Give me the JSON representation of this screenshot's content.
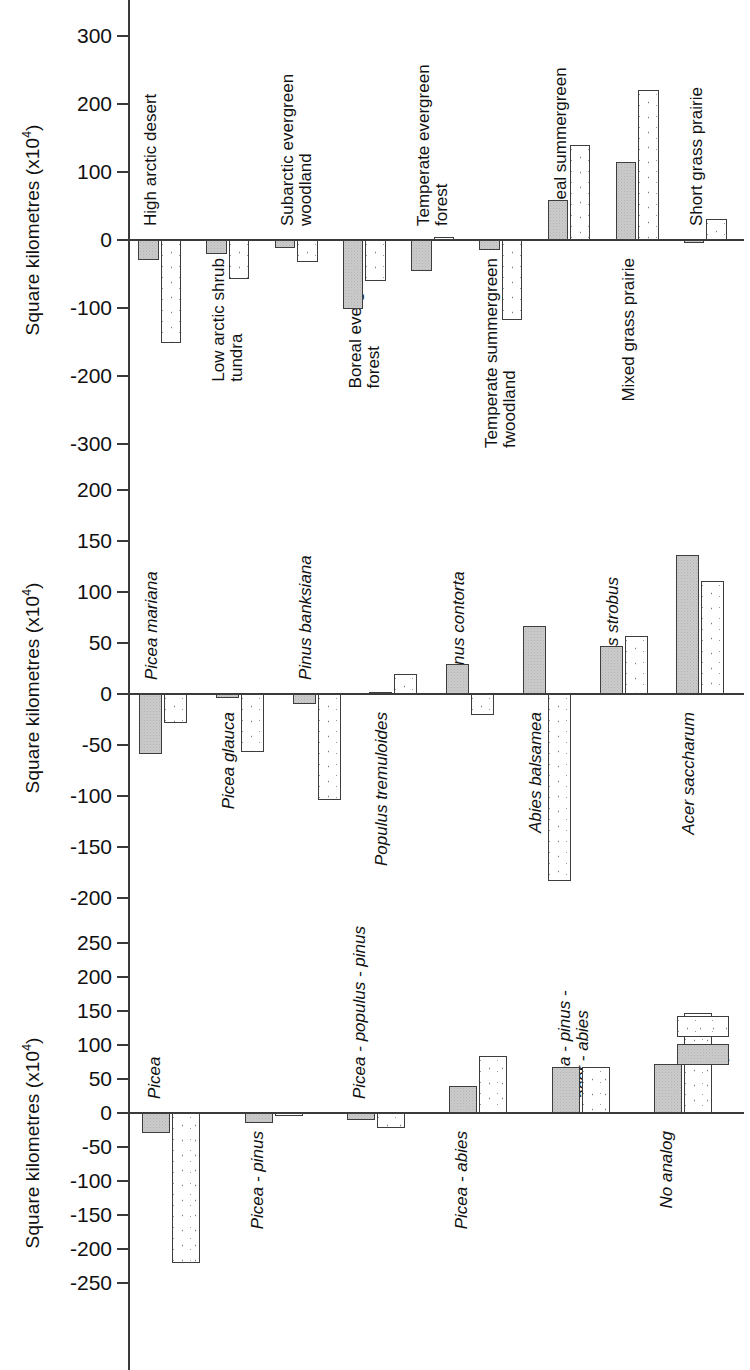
{
  "figure": {
    "axis_label_prefix": "Square kilometres (x10",
    "axis_label_exponent": "4",
    "axis_label_suffix": ")"
  },
  "legend": {
    "position": "right-middle-of-panel-3",
    "entries": [
      {
        "label": "GISS",
        "key": "giss",
        "color": "#ffffff",
        "pattern": "white-sparse-dots"
      },
      {
        "label": "GFDL",
        "key": "gfdl",
        "color": "#cacaca",
        "pattern": "solid-grey-stipple"
      }
    ]
  },
  "chart_data": [
    {
      "type": "bar",
      "title": "Biome area change",
      "xlabel": "",
      "ylabel": "Square kilometres (x10^4)",
      "ylim": [
        -300,
        300
      ],
      "yticks": [
        300,
        200,
        100,
        0,
        -100,
        -200,
        -300
      ],
      "ytick_labels": [
        "300",
        "200",
        "100",
        "0",
        "-100",
        "-200",
        "-300"
      ],
      "grid": false,
      "legend": false,
      "label_style": "upright",
      "categories": [
        "High arctic desert",
        "Low arctic shrub\ntundra",
        "Subarctic evergreen\nwoodland",
        "Boreal evergreen\nforest",
        "Temperate evergreen\nforest",
        "Temperate summergreen\nfwoodland",
        "Boreal summergreen\nwoodland",
        "Mixed grass prairie",
        "Short grass prairie"
      ],
      "category_label_anchor": [
        "above",
        "below",
        "above",
        "below",
        "above",
        "below",
        "above",
        "below",
        "above"
      ],
      "series": [
        {
          "name": "GFDL",
          "key": "gfdl",
          "values": [
            -30,
            -20,
            -12,
            -102,
            -45,
            -14,
            59,
            115,
            -5
          ]
        },
        {
          "name": "GISS",
          "key": "giss",
          "values": [
            -152,
            -58,
            -32,
            -60,
            4,
            -118,
            139,
            220,
            31
          ]
        }
      ]
    },
    {
      "type": "bar",
      "title": "Species area change",
      "xlabel": "",
      "ylabel": "Square kilometres (x10^4)",
      "ylim": [
        -200,
        200
      ],
      "yticks": [
        200,
        150,
        100,
        50,
        0,
        -50,
        -100,
        -150,
        -200
      ],
      "ytick_labels": [
        "200",
        "150",
        "100",
        "50",
        "0",
        "-50",
        "-100",
        "-150",
        "-200"
      ],
      "grid": false,
      "legend": false,
      "label_style": "italic",
      "categories": [
        "Picea mariana",
        "Picea glauca",
        "Pinus banksiana",
        "Populus tremuloides",
        "Pinus contorta",
        "Abies balsamea",
        "Pinus strobus",
        "Acer saccharum"
      ],
      "category_label_anchor": [
        "above",
        "below",
        "above",
        "below",
        "above",
        "below",
        "above",
        "below"
      ],
      "series": [
        {
          "name": "GFDL",
          "key": "gfdl",
          "values": [
            -59,
            -4,
            -10,
            2,
            29,
            67,
            47,
            136
          ]
        },
        {
          "name": "GISS",
          "key": "giss",
          "values": [
            -28,
            -57,
            -104,
            20,
            -21,
            -183,
            57,
            111
          ]
        }
      ]
    },
    {
      "type": "bar",
      "title": "Forest-type area change",
      "xlabel": "",
      "ylabel": "Square kilometres (x10^4)",
      "ylim": [
        -250,
        250
      ],
      "yticks": [
        250,
        200,
        150,
        100,
        50,
        0,
        -50,
        -100,
        -150,
        -200,
        -250
      ],
      "ytick_labels": [
        "250",
        "200",
        "150",
        "100",
        "50",
        "0",
        "-50",
        "-100",
        "-150",
        "-200",
        "-250"
      ],
      "grid": false,
      "legend": true,
      "label_style": "italic",
      "categories": [
        "Picea",
        "Picea - pinus",
        "Picea - populus - pinus",
        "Picea - abies",
        "Picea - pinus -\nacer - abies",
        "No analog"
      ],
      "category_label_anchor": [
        "above",
        "below",
        "above",
        "below",
        "above",
        "below"
      ],
      "series": [
        {
          "name": "GFDL",
          "key": "gfdl",
          "values": [
            -29,
            -14,
            -11,
            39,
            68,
            72
          ]
        },
        {
          "name": "GISS",
          "key": "giss",
          "values": [
            -221,
            -2,
            -22,
            84,
            68,
            147
          ]
        }
      ]
    }
  ]
}
